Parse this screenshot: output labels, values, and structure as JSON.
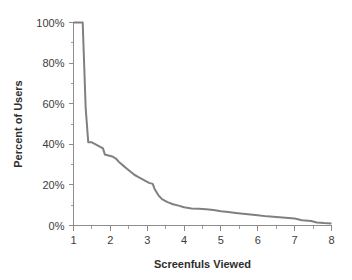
{
  "chart_data": {
    "type": "line",
    "title": "",
    "xlabel": "Screenfuls Viewed",
    "ylabel": "Percent of Users",
    "xlim": [
      1,
      8
    ],
    "ylim": [
      0,
      100
    ],
    "grid": false,
    "legend": "none",
    "line_color": "#808080",
    "text_color": "#3c3c3c",
    "axis_color": "#8c8c8c",
    "background": "#ffffff",
    "x_ticks": [
      1,
      2,
      3,
      4,
      5,
      6,
      7,
      8
    ],
    "x_tick_labels": [
      "1",
      "2",
      "3",
      "4",
      "5",
      "6",
      "7",
      "8"
    ],
    "x_minor_ticks": [
      1.5,
      2.5,
      3.5,
      4.5,
      5.5,
      6.5,
      7.5
    ],
    "y_ticks": [
      0,
      20,
      40,
      60,
      80,
      100
    ],
    "y_tick_labels": [
      "0%",
      "20%",
      "40%",
      "60%",
      "80%",
      "100%"
    ],
    "y_minor_ticks": [
      10,
      30,
      50,
      70,
      90
    ],
    "series": [
      {
        "name": "Percent of Users",
        "x": [
          1.0,
          1.1,
          1.2,
          1.25,
          1.28,
          1.33,
          1.4,
          1.5,
          1.6,
          1.7,
          1.8,
          1.85,
          1.95,
          2.05,
          2.15,
          2.25,
          2.35,
          2.45,
          2.55,
          2.65,
          2.75,
          2.85,
          2.95,
          3.05,
          3.15,
          3.2,
          3.3,
          3.4,
          3.55,
          3.7,
          3.85,
          4.0,
          4.2,
          4.4,
          4.6,
          4.8,
          5.0,
          5.2,
          5.4,
          5.6,
          5.8,
          6.0,
          6.25,
          6.5,
          6.75,
          7.0,
          7.2,
          7.45,
          7.6,
          7.8,
          8.0
        ],
        "values": [
          100,
          100,
          100,
          100,
          84,
          58,
          41,
          41,
          40,
          39,
          38,
          35,
          34.5,
          34,
          33,
          31,
          29.5,
          28,
          26.5,
          25,
          24,
          23,
          22,
          21,
          20.5,
          18,
          15,
          13,
          11.5,
          10.5,
          9.8,
          9.0,
          8.4,
          8.2,
          8.0,
          7.6,
          7.0,
          6.6,
          6.2,
          5.8,
          5.4,
          5.0,
          4.5,
          4.2,
          3.8,
          3.4,
          2.6,
          2.2,
          1.5,
          1.2,
          1.0
        ]
      }
    ]
  },
  "labels": {
    "x_axis_title": "Screenfuls Viewed",
    "y_axis_title": "Percent of Users"
  }
}
